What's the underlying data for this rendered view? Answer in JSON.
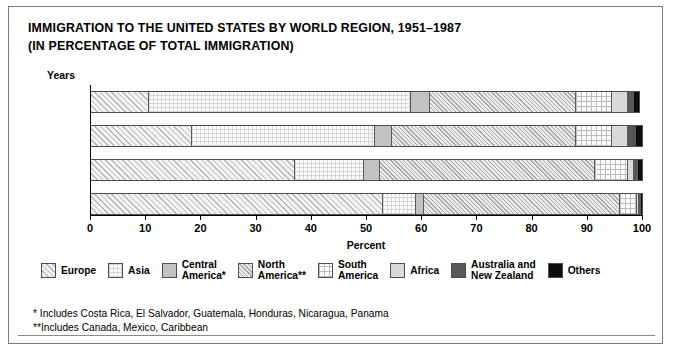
{
  "title": {
    "line1": "IMMIGRATION TO THE UNITED STATES BY WORLD REGION, 1951–1987",
    "line2": "(IN PERCENTAGE OF TOTAL IMMIGRATION)"
  },
  "years_header": "Years",
  "legend": [
    {
      "label": "Europe",
      "key": "europe",
      "color": "#f2f2f2"
    },
    {
      "label": "Asia",
      "key": "asia",
      "color": "#fbfbfb"
    },
    {
      "label": "Central\nAmerica*",
      "key": "central",
      "color": "#c2c2c2"
    },
    {
      "label": "North\nAmerica**",
      "key": "north",
      "color": "#ebebeb"
    },
    {
      "label": "South\nAmerica",
      "key": "south",
      "color": "#fcfcfc"
    },
    {
      "label": "Africa",
      "key": "africa",
      "color": "#d9d9d9"
    },
    {
      "label": "Australia and\nNew Zealand",
      "key": "aus",
      "color": "#575757"
    },
    {
      "label": "Others",
      "key": "others",
      "color": "#0d0d0d"
    }
  ],
  "footnotes": {
    "one": "*  Includes Costa Rica, El Salvador, Guatemala, Honduras, Nicaragua, Panama",
    "two": "**Includes Canada, Mexico, Caribbean"
  },
  "chart_data": {
    "type": "bar",
    "orientation": "horizontal",
    "stacked": true,
    "title": "IMMIGRATION TO THE UNITED STATES BY WORLD REGION, 1951–1987 (IN PERCENTAGE OF TOTAL IMMIGRATION)",
    "xlabel": "Percent",
    "ylabel": "Years",
    "xlim": [
      0,
      100
    ],
    "xticks": [
      0,
      10,
      20,
      30,
      40,
      50,
      60,
      70,
      80,
      90,
      100
    ],
    "xtick_labels": [
      "0",
      "10",
      "20",
      "30",
      "40",
      "50",
      "60",
      "70",
      "80",
      "90",
      "100"
    ],
    "grid": false,
    "legend_position": "bottom",
    "categories": [
      "1981–1987",
      "1971–1980",
      "1961–1970",
      "1951–1960"
    ],
    "series": [
      {
        "name": "Europe",
        "key": "europe",
        "values": [
          10.5,
          18.3,
          37.0,
          53.0
        ]
      },
      {
        "name": "Asia",
        "key": "asia",
        "values": [
          47.5,
          33.3,
          12.5,
          6.0
        ]
      },
      {
        "name": "Central America*",
        "key": "central",
        "values": [
          3.5,
          3.0,
          3.0,
          1.5
        ]
      },
      {
        "name": "North America**",
        "key": "north",
        "values": [
          26.5,
          33.4,
          39.0,
          35.5
        ]
      },
      {
        "name": "South America",
        "key": "south",
        "values": [
          6.5,
          6.5,
          6.0,
          3.0
        ]
      },
      {
        "name": "Africa",
        "key": "africa",
        "values": [
          3.0,
          3.0,
          1.0,
          0.5
        ]
      },
      {
        "name": "Australia and New Zealand",
        "key": "aus",
        "values": [
          1.0,
          1.5,
          0.8,
          0.3
        ]
      },
      {
        "name": "Others",
        "key": "others",
        "values": [
          1.0,
          1.0,
          0.7,
          0.2
        ]
      }
    ]
  }
}
